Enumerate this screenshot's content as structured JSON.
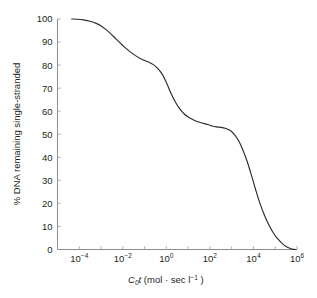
{
  "chart_data": {
    "type": "line",
    "title": "",
    "subtitle": "",
    "xlabel": "C₀t (mol · sec l⁻¹)",
    "xlabel_parts": {
      "italic_c": "C",
      "sub_zero": "0",
      "italic_t": "t",
      "rest_open": " (mol · sec l",
      "sup": "−1",
      "rest_close": " )"
    },
    "ylabel": "% DNA remaining single-stranded",
    "x_scale": "log10",
    "xlim": [
      -5,
      6
    ],
    "ylim": [
      0,
      100
    ],
    "grid": false,
    "legend": "none",
    "x_tick_labels": [
      {
        "mantissa": "10",
        "exponent": "−4",
        "log_value": -4
      },
      {
        "mantissa": "10",
        "exponent": "−2",
        "log_value": -2
      },
      {
        "mantissa": "10",
        "exponent": "0",
        "log_value": 0
      },
      {
        "mantissa": "10",
        "exponent": "2",
        "log_value": 2
      },
      {
        "mantissa": "10",
        "exponent": "4",
        "log_value": 4
      },
      {
        "mantissa": "10",
        "exponent": "6",
        "log_value": 6
      }
    ],
    "x_minor_log_ticks": [
      -5,
      -4,
      -3,
      -2,
      -1,
      0,
      1,
      2,
      3,
      4,
      5,
      6
    ],
    "y_tick_labels": [
      "0",
      "10",
      "20",
      "30",
      "40",
      "50",
      "60",
      "70",
      "80",
      "90",
      "100"
    ],
    "y_tick_values": [
      0,
      10,
      20,
      30,
      40,
      50,
      60,
      70,
      80,
      90,
      100
    ],
    "series": [
      {
        "name": "DNA reassociation (Cot curve)",
        "color": "#2b2b2b",
        "points": [
          {
            "log_x": -4.35,
            "y": 100.0
          },
          {
            "log_x": -4.1,
            "y": 99.9
          },
          {
            "log_x": -3.8,
            "y": 99.6
          },
          {
            "log_x": -3.5,
            "y": 99.0
          },
          {
            "log_x": -3.2,
            "y": 98.0
          },
          {
            "log_x": -3.0,
            "y": 97.0
          },
          {
            "log_x": -2.8,
            "y": 95.6
          },
          {
            "log_x": -2.6,
            "y": 94.0
          },
          {
            "log_x": -2.4,
            "y": 92.2
          },
          {
            "log_x": -2.2,
            "y": 90.3
          },
          {
            "log_x": -2.0,
            "y": 88.5
          },
          {
            "log_x": -1.8,
            "y": 86.8
          },
          {
            "log_x": -1.6,
            "y": 85.3
          },
          {
            "log_x": -1.4,
            "y": 84.0
          },
          {
            "log_x": -1.2,
            "y": 82.9
          },
          {
            "log_x": -1.0,
            "y": 82.0
          },
          {
            "log_x": -0.8,
            "y": 81.2
          },
          {
            "log_x": -0.6,
            "y": 80.2
          },
          {
            "log_x": -0.4,
            "y": 78.6
          },
          {
            "log_x": -0.2,
            "y": 76.2
          },
          {
            "log_x": 0.0,
            "y": 72.5
          },
          {
            "log_x": 0.2,
            "y": 68.0
          },
          {
            "log_x": 0.4,
            "y": 64.2
          },
          {
            "log_x": 0.6,
            "y": 61.2
          },
          {
            "log_x": 0.8,
            "y": 59.0
          },
          {
            "log_x": 1.0,
            "y": 57.5
          },
          {
            "log_x": 1.3,
            "y": 56.0
          },
          {
            "log_x": 1.6,
            "y": 55.0
          },
          {
            "log_x": 1.9,
            "y": 54.2
          },
          {
            "log_x": 2.1,
            "y": 53.6
          },
          {
            "log_x": 2.3,
            "y": 53.2
          },
          {
            "log_x": 2.5,
            "y": 53.0
          },
          {
            "log_x": 2.7,
            "y": 52.6
          },
          {
            "log_x": 2.9,
            "y": 51.8
          },
          {
            "log_x": 3.1,
            "y": 50.2
          },
          {
            "log_x": 3.3,
            "y": 47.5
          },
          {
            "log_x": 3.5,
            "y": 43.5
          },
          {
            "log_x": 3.7,
            "y": 38.5
          },
          {
            "log_x": 3.9,
            "y": 32.5
          },
          {
            "log_x": 4.1,
            "y": 26.0
          },
          {
            "log_x": 4.3,
            "y": 20.0
          },
          {
            "log_x": 4.5,
            "y": 15.0
          },
          {
            "log_x": 4.7,
            "y": 10.8
          },
          {
            "log_x": 4.9,
            "y": 7.4
          },
          {
            "log_x": 5.1,
            "y": 4.8
          },
          {
            "log_x": 5.3,
            "y": 2.8
          },
          {
            "log_x": 5.5,
            "y": 1.3
          },
          {
            "log_x": 5.7,
            "y": 0.4
          },
          {
            "log_x": 5.85,
            "y": 0.05
          },
          {
            "log_x": 5.95,
            "y": 0.0
          }
        ],
        "plateaus": [
          {
            "label": "highly repetitive",
            "approx_y": 100
          },
          {
            "label": "moderately repetitive",
            "approx_y": 80
          },
          {
            "label": "single-copy shoulder",
            "approx_y": 53
          },
          {
            "label": "fully reassociated",
            "approx_y": 0
          }
        ]
      }
    ]
  },
  "colors": {
    "curve": "#2b2b2b",
    "axis": "#7f7f7f",
    "tick": "#9a9a9a",
    "text": "#231f20",
    "background": "#ffffff"
  }
}
